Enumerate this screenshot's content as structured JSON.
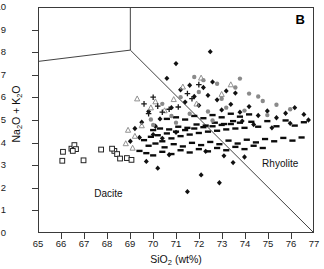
{
  "chart_data": {
    "type": "scatter",
    "title": "",
    "panel_label": "B",
    "xlabel": "SiO2 (wt%)",
    "xlabel_parts": {
      "pre": "SiO",
      "sub": "2",
      "post": " (wt%)"
    },
    "ylabel": "Na2O + K2O",
    "ylabel_parts": {
      "a": "Na",
      "a_sub": "2",
      "b": "O + K",
      "b_sub": "2",
      "c": "O"
    },
    "xlim": [
      65,
      77
    ],
    "ylim": [
      0,
      10
    ],
    "xticks": [
      65,
      66,
      67,
      68,
      69,
      70,
      71,
      72,
      73,
      74,
      75,
      76,
      77
    ],
    "yticks": [
      0,
      1,
      2,
      3,
      4,
      5,
      6,
      7,
      8,
      9,
      10
    ],
    "grid": false,
    "legend": "none",
    "field_labels": [
      {
        "text": "Dacite",
        "x": 67.4,
        "y": 1.75
      },
      {
        "text": "Rhyolite",
        "x": 74.7,
        "y": 3.1
      }
    ],
    "boundaries": [
      {
        "name": "trachyte-rhyolite-vertical",
        "points": [
          [
            69.0,
            10.0
          ],
          [
            69.0,
            8.12
          ]
        ]
      },
      {
        "name": "trachyte-dacite-left",
        "points": [
          [
            65.0,
            7.62
          ],
          [
            69.0,
            8.12
          ]
        ]
      },
      {
        "name": "dacite-rhyolite-diagonal",
        "points": [
          [
            69.0,
            8.12
          ],
          [
            77.0,
            0.0
          ]
        ]
      }
    ],
    "series": [
      {
        "name": "open-squares",
        "marker": "open-square",
        "color": "#222222",
        "fill": "none",
        "points": [
          [
            66.05,
            3.58
          ],
          [
            66.02,
            3.18
          ],
          [
            66.42,
            3.72
          ],
          [
            66.55,
            3.88
          ],
          [
            66.62,
            3.7
          ],
          [
            66.48,
            3.62
          ],
          [
            66.95,
            3.2
          ],
          [
            67.72,
            3.68
          ],
          [
            68.3,
            3.62
          ],
          [
            68.42,
            3.48
          ],
          [
            68.55,
            3.28
          ],
          [
            68.85,
            3.3
          ],
          [
            69.05,
            3.22
          ],
          [
            68.2,
            3.72
          ]
        ]
      },
      {
        "name": "filled-diamonds",
        "marker": "diamond",
        "color": "#111111",
        "points": [
          [
            72.5,
            8.05
          ],
          [
            71.0,
            7.52
          ],
          [
            70.6,
            6.86
          ],
          [
            73.2,
            6.3
          ],
          [
            69.8,
            5.38
          ],
          [
            70.3,
            5.05
          ],
          [
            69.2,
            4.62
          ],
          [
            69.5,
            4.9
          ],
          [
            70.1,
            4.72
          ],
          [
            70.8,
            5.55
          ],
          [
            71.4,
            5.8
          ],
          [
            71.8,
            6.05
          ],
          [
            72.0,
            5.65
          ],
          [
            72.4,
            6.1
          ],
          [
            72.8,
            5.9
          ],
          [
            73.0,
            5.45
          ],
          [
            73.4,
            5.7
          ],
          [
            73.8,
            5.35
          ],
          [
            74.2,
            5.6
          ],
          [
            74.6,
            5.2
          ],
          [
            75.0,
            5.4
          ],
          [
            75.4,
            5.1
          ],
          [
            75.8,
            5.3
          ],
          [
            76.2,
            5.55
          ],
          [
            76.6,
            5.25
          ],
          [
            71.2,
            6.35
          ],
          [
            71.6,
            6.55
          ],
          [
            72.2,
            6.45
          ],
          [
            72.6,
            6.7
          ],
          [
            73.6,
            6.2
          ],
          [
            70.0,
            4.35
          ],
          [
            70.4,
            4.18
          ],
          [
            71.0,
            4.45
          ],
          [
            69.0,
            4.05
          ],
          [
            69.4,
            4.22
          ],
          [
            73.9,
            4.95
          ],
          [
            74.4,
            4.8
          ],
          [
            75.2,
            4.65
          ],
          [
            76.0,
            4.85
          ],
          [
            76.8,
            5.0
          ],
          [
            72.1,
            2.55
          ],
          [
            72.9,
            2.2
          ],
          [
            70.2,
            2.85
          ],
          [
            71.5,
            1.8
          ],
          [
            73.5,
            3.1
          ],
          [
            74.0,
            3.35
          ],
          [
            70.7,
            3.45
          ],
          [
            69.7,
            3.15
          ],
          [
            72.3,
            3.6
          ],
          [
            73.1,
            3.4
          ]
        ]
      },
      {
        "name": "dash-bars",
        "marker": "dash",
        "color": "#0b0b0b",
        "points": [
          [
            69.6,
            4.1
          ],
          [
            69.9,
            4.25
          ],
          [
            70.2,
            4.32
          ],
          [
            70.4,
            4.05
          ],
          [
            70.6,
            4.4
          ],
          [
            70.8,
            4.18
          ],
          [
            71.0,
            4.48
          ],
          [
            71.2,
            4.28
          ],
          [
            71.4,
            4.55
          ],
          [
            71.6,
            4.35
          ],
          [
            71.8,
            4.62
          ],
          [
            72.0,
            4.42
          ],
          [
            72.2,
            4.68
          ],
          [
            72.4,
            4.48
          ],
          [
            72.6,
            4.72
          ],
          [
            72.8,
            4.52
          ],
          [
            73.0,
            4.78
          ],
          [
            73.2,
            4.58
          ],
          [
            73.4,
            4.82
          ],
          [
            73.6,
            4.62
          ],
          [
            73.8,
            4.88
          ],
          [
            74.0,
            4.65
          ],
          [
            74.3,
            4.92
          ],
          [
            74.6,
            4.7
          ],
          [
            75.0,
            4.95
          ],
          [
            75.4,
            4.72
          ],
          [
            75.8,
            4.98
          ],
          [
            76.2,
            4.75
          ],
          [
            76.6,
            4.9
          ],
          [
            69.8,
            3.85
          ],
          [
            70.1,
            3.95
          ],
          [
            70.5,
            3.78
          ],
          [
            70.9,
            3.92
          ],
          [
            71.3,
            3.82
          ],
          [
            71.7,
            3.98
          ],
          [
            72.1,
            3.88
          ],
          [
            72.5,
            4.02
          ],
          [
            72.9,
            3.92
          ],
          [
            73.3,
            4.08
          ],
          [
            73.7,
            3.95
          ],
          [
            74.1,
            4.12
          ],
          [
            74.5,
            4.0
          ],
          [
            74.9,
            4.15
          ],
          [
            75.3,
            4.05
          ],
          [
            75.7,
            4.2
          ],
          [
            76.1,
            4.08
          ],
          [
            76.5,
            4.22
          ],
          [
            70.0,
            4.55
          ],
          [
            70.3,
            4.62
          ],
          [
            70.7,
            4.58
          ],
          [
            71.1,
            4.7
          ],
          [
            71.5,
            4.65
          ],
          [
            71.9,
            4.8
          ],
          [
            72.3,
            4.75
          ],
          [
            72.7,
            4.88
          ],
          [
            73.1,
            4.82
          ],
          [
            73.5,
            4.95
          ],
          [
            69.4,
            3.62
          ],
          [
            69.7,
            3.52
          ],
          [
            70.0,
            3.42
          ],
          [
            70.4,
            3.58
          ],
          [
            70.8,
            3.48
          ],
          [
            71.2,
            3.65
          ],
          [
            71.6,
            3.55
          ],
          [
            72.0,
            3.7
          ],
          [
            72.4,
            3.6
          ],
          [
            72.8,
            3.75
          ],
          [
            73.2,
            3.65
          ],
          [
            73.6,
            3.8
          ],
          [
            74.0,
            3.7
          ],
          [
            74.4,
            3.85
          ],
          [
            74.8,
            3.75
          ],
          [
            70.6,
            5.05
          ],
          [
            71.0,
            5.12
          ],
          [
            71.4,
            5.02
          ],
          [
            71.8,
            5.18
          ],
          [
            72.2,
            5.08
          ],
          [
            72.6,
            5.22
          ],
          [
            73.0,
            5.12
          ],
          [
            73.4,
            5.28
          ],
          [
            73.8,
            5.15
          ],
          [
            74.2,
            5.25
          ]
        ]
      },
      {
        "name": "gray-circles",
        "marker": "circle",
        "color": "#8a8a8a",
        "points": [
          [
            72.8,
            6.62
          ],
          [
            73.6,
            6.45
          ],
          [
            74.2,
            6.18
          ],
          [
            73.0,
            5.95
          ],
          [
            72.0,
            6.25
          ],
          [
            71.2,
            6.02
          ],
          [
            70.4,
            5.72
          ],
          [
            74.8,
            5.85
          ],
          [
            75.4,
            5.68
          ],
          [
            76.0,
            5.48
          ],
          [
            73.2,
            5.55
          ],
          [
            72.4,
            5.38
          ],
          [
            71.6,
            5.28
          ],
          [
            70.8,
            5.18
          ],
          [
            69.9,
            5.02
          ],
          [
            74.0,
            5.42
          ],
          [
            75.0,
            5.22
          ],
          [
            72.6,
            4.98
          ],
          [
            71.0,
            4.88
          ],
          [
            70.0,
            4.78
          ],
          [
            73.8,
            6.85
          ],
          [
            72.2,
            6.78
          ],
          [
            71.8,
            6.92
          ],
          [
            74.6,
            6.05
          ]
        ]
      },
      {
        "name": "gray-triangles",
        "marker": "triangle",
        "color": "#909090",
        "points": [
          [
            69.3,
            5.95
          ],
          [
            69.9,
            5.55
          ],
          [
            70.5,
            5.42
          ],
          [
            68.9,
            4.55
          ],
          [
            69.2,
            4.28
          ],
          [
            70.1,
            5.82
          ],
          [
            71.3,
            6.48
          ],
          [
            72.1,
            6.88
          ],
          [
            73.4,
            6.58
          ],
          [
            70.9,
            5.92
          ],
          [
            68.8,
            3.95
          ],
          [
            69.1,
            3.75
          ],
          [
            69.5,
            4.75
          ],
          [
            71.9,
            5.72
          ],
          [
            73.0,
            6.15
          ]
        ]
      },
      {
        "name": "plus-crosses",
        "marker": "plus",
        "color": "#1a1a1a",
        "points": [
          [
            70.2,
            5.62
          ],
          [
            70.7,
            5.48
          ],
          [
            71.1,
            5.58
          ],
          [
            69.8,
            5.28
          ],
          [
            70.4,
            5.35
          ],
          [
            71.5,
            6.18
          ],
          [
            72.0,
            6.58
          ],
          [
            71.7,
            5.95
          ],
          [
            70.0,
            6.02
          ],
          [
            69.6,
            5.72
          ]
        ]
      }
    ]
  }
}
